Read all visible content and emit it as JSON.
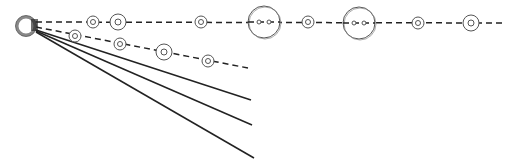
{
  "canvas": {
    "width": 513,
    "height": 167,
    "background": "#ffffff"
  },
  "colors": {
    "stroke": "#222222",
    "ring": "#555555",
    "ring_light": "#888888"
  },
  "origin": {
    "cx": 26,
    "cy": 26,
    "r": 9
  },
  "origin_stubs": [
    {
      "x1": 31,
      "y1": 20,
      "x2": 38,
      "y2": 20
    },
    {
      "x1": 31,
      "y1": 22,
      "x2": 38,
      "y2": 22
    },
    {
      "x1": 31,
      "y1": 24,
      "x2": 38,
      "y2": 24
    },
    {
      "x1": 31,
      "y1": 26,
      "x2": 38,
      "y2": 26
    },
    {
      "x1": 31,
      "y1": 28,
      "x2": 38,
      "y2": 28
    },
    {
      "x1": 31,
      "y1": 30,
      "x2": 38,
      "y2": 30
    }
  ],
  "dashed_lines": [
    {
      "name": "dashed-line-top",
      "x1": 36,
      "y1": 22,
      "x2": 503,
      "y2": 23
    },
    {
      "name": "dashed-line-lower",
      "x1": 36,
      "y1": 27,
      "x2": 248,
      "y2": 68
    }
  ],
  "solid_lines": [
    {
      "name": "solid-line-1",
      "x1": 36,
      "y1": 30,
      "x2": 251,
      "y2": 100
    },
    {
      "name": "solid-line-2",
      "x1": 36,
      "y1": 31,
      "x2": 252,
      "y2": 125
    },
    {
      "name": "solid-line-3",
      "x1": 36,
      "y1": 32,
      "x2": 254,
      "y2": 158
    }
  ],
  "nodes_top": [
    {
      "cx": 93,
      "cy": 22,
      "outer": 6,
      "inner": 2.5,
      "type": "small"
    },
    {
      "cx": 118,
      "cy": 22,
      "outer": 8,
      "inner": 3,
      "type": "medium"
    },
    {
      "cx": 201,
      "cy": 22,
      "outer": 6,
      "inner": 2.5,
      "type": "small"
    },
    {
      "cx": 264,
      "cy": 22,
      "outer": 16,
      "inner": 2,
      "type": "large-double"
    },
    {
      "cx": 308,
      "cy": 22,
      "outer": 6,
      "inner": 2.5,
      "type": "small"
    },
    {
      "cx": 359,
      "cy": 23,
      "outer": 16,
      "inner": 2,
      "type": "large-double"
    },
    {
      "cx": 418,
      "cy": 23,
      "outer": 6,
      "inner": 2.5,
      "type": "small"
    },
    {
      "cx": 471,
      "cy": 23,
      "outer": 8,
      "inner": 3,
      "type": "medium"
    }
  ],
  "nodes_lower": [
    {
      "cx": 75,
      "cy": 36,
      "outer": 6,
      "inner": 2.5,
      "type": "small"
    },
    {
      "cx": 120,
      "cy": 44,
      "outer": 6,
      "inner": 2.5,
      "type": "small"
    },
    {
      "cx": 164,
      "cy": 52,
      "outer": 8,
      "inner": 3,
      "type": "medium"
    },
    {
      "cx": 208,
      "cy": 61,
      "outer": 6,
      "inner": 2.5,
      "type": "small"
    }
  ]
}
